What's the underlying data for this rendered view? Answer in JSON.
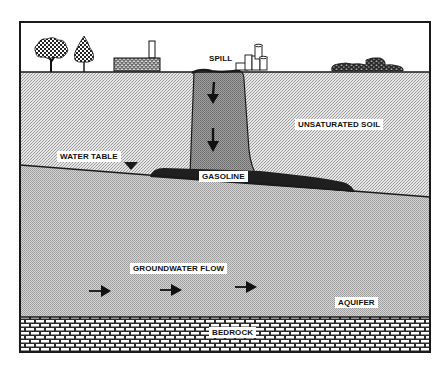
{
  "diagram": {
    "type": "cross-section",
    "labels": {
      "spill": "SPILL",
      "unsaturated_soil": "UNSATURATED SOIL",
      "water_table": "WATER TABLE",
      "gasoline": "GASOLINE",
      "groundwater_flow": "GROUNDWATER FLOW",
      "aquifer": "AQUIFER",
      "bedrock": "BEDROCK"
    },
    "surface_features": [
      "deciduous-tree",
      "conifer-tree",
      "brick-building-with-chimney",
      "storage-tanks",
      "debris-pile"
    ],
    "layers": [
      "surface",
      "unsaturated soil",
      "water table",
      "aquifer",
      "bedrock"
    ],
    "flow_arrows_count": 3,
    "plume_arrows_count": 2,
    "colors": {
      "frame": "#1a1a1a",
      "soil_light": "#d9d9d9",
      "soil_dark": "#b8b8b8",
      "plume": "#8c8c8c",
      "gasoline_pool": "#1f1f1f",
      "bedrock_brick": "#ffffff"
    }
  }
}
